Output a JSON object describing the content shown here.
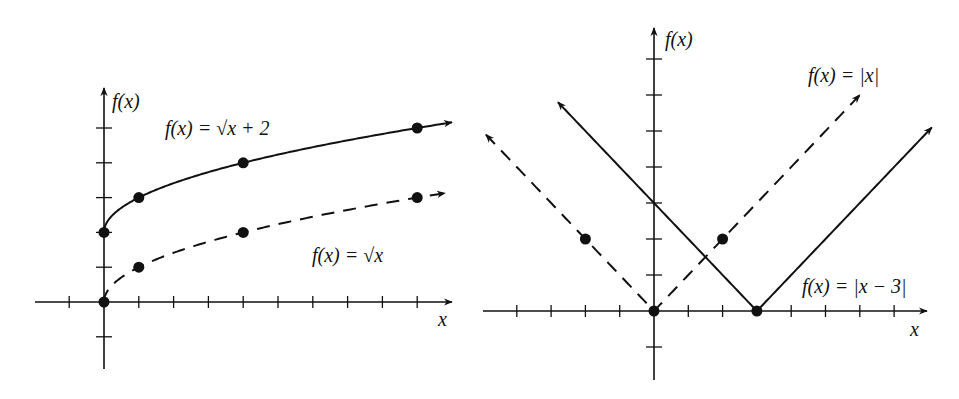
{
  "chart_data": [
    {
      "type": "line",
      "title": "",
      "xlabel": "x",
      "ylabel": "f(x)",
      "xlim": [
        -2,
        10
      ],
      "ylim": [
        -2,
        6
      ],
      "x_ticks": [
        -1,
        1,
        2,
        3,
        4,
        5,
        6,
        7,
        8,
        9
      ],
      "y_ticks": [
        -1,
        1,
        2,
        3,
        4,
        5
      ],
      "grid": false,
      "legend": "inline labels",
      "series": [
        {
          "name": "f(x) = √x + 2",
          "style": "solid",
          "function": "sqrt(x)+2",
          "x_range": [
            0,
            10
          ],
          "points": [
            [
              0,
              2
            ],
            [
              1,
              3
            ],
            [
              4,
              4
            ],
            [
              9,
              5
            ]
          ],
          "arrow_end": "right",
          "label": {
            "text": "f(x) = √x + 2"
          }
        },
        {
          "name": "f(x) = √x",
          "style": "dashed",
          "function": "sqrt(x)",
          "x_range": [
            0,
            9.8
          ],
          "points": [
            [
              0,
              0
            ],
            [
              1,
              1
            ],
            [
              4,
              2
            ],
            [
              9,
              3
            ]
          ],
          "arrow_end": "right",
          "label": {
            "text": "f(x) = √x"
          }
        }
      ]
    },
    {
      "type": "line",
      "title": "",
      "xlabel": "x",
      "ylabel": "f(x)",
      "xlim": [
        -5,
        8
      ],
      "ylim": [
        -2,
        8
      ],
      "x_ticks": [
        -4,
        -3,
        -2,
        -1,
        1,
        2,
        4,
        5,
        6,
        7
      ],
      "y_ticks": [
        -1,
        1,
        2,
        3,
        4,
        5,
        6,
        7
      ],
      "grid": false,
      "legend": "inline labels",
      "series": [
        {
          "name": "f(x) = |x|",
          "style": "dashed",
          "function": "abs(x)",
          "x_range": [
            -4.9,
            6
          ],
          "points": [
            [
              -2,
              2
            ],
            [
              0,
              0
            ],
            [
              2,
              2
            ]
          ],
          "arrow_end": "both",
          "label": {
            "text": "f(x) = |x|"
          }
        },
        {
          "name": "f(x) = |x − 3|",
          "style": "solid",
          "function": "abs(x-3)",
          "x_range": [
            -2.8,
            8.1
          ],
          "points": [
            [
              3,
              0
            ]
          ],
          "arrow_end": "both",
          "label": {
            "text": "f(x) = |x − 3|"
          }
        }
      ]
    }
  ],
  "labels": {
    "left_y_axis": "f(x)",
    "left_x_axis": "x",
    "right_y_axis": "f(x)",
    "right_x_axis": "x",
    "left_curve_top": "f(x) = √x + 2",
    "left_curve_bottom": "f(x) = √x",
    "right_curve_abs": "f(x) = |x|",
    "right_curve_shift": "f(x) = |x − 3|"
  },
  "colors": {
    "ink": "#111111",
    "background": "#ffffff"
  }
}
